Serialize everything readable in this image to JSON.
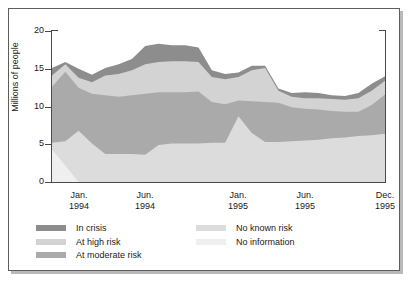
{
  "chart_data": {
    "type": "area",
    "stacked": true,
    "title": "",
    "xlabel": "",
    "ylabel": "Millions of people",
    "ylim": [
      0,
      20
    ],
    "yticks": [
      0,
      5,
      10,
      15,
      20
    ],
    "ytick_labels": [
      "0",
      "5",
      "10",
      "15",
      "20"
    ],
    "grid": false,
    "legend_position": "below-plot",
    "x": [
      "Nov. 1993",
      "Dec. 1993",
      "Jan. 1994",
      "Feb. 1994",
      "Mar. 1994",
      "Apr. 1994",
      "May 1994",
      "Jun. 1994",
      "Jul. 1994",
      "Aug. 1994",
      "Sep. 1994",
      "Oct. 1994",
      "Nov. 1994",
      "Dec. 1994",
      "Jan. 1995",
      "Feb. 1995",
      "Mar. 1995",
      "Apr. 1995",
      "May 1995",
      "Jun. 1995",
      "Jul. 1995",
      "Aug. 1995",
      "Sep. 1995",
      "Oct. 1995",
      "Nov. 1995",
      "Dec. 1995"
    ],
    "xtick_labels": [
      {
        "month": "Jan.",
        "year": "1994"
      },
      {
        "month": "Jun.",
        "year": "1994"
      },
      {
        "month": "Jan.",
        "year": "1995"
      },
      {
        "month": "Jun.",
        "year": "1995"
      },
      {
        "month": "Dec.",
        "year": "1995"
      }
    ],
    "xtick_index": [
      2,
      7,
      14,
      19,
      25
    ],
    "series": [
      {
        "name": "No information",
        "color": "#efefef",
        "stack_order": 1,
        "values": [
          4.3,
          2.2,
          0.0,
          0.0,
          0.0,
          0.0,
          0.0,
          0.0,
          0.0,
          0.0,
          0.0,
          0.0,
          0.0,
          0.0,
          0.0,
          0.0,
          0.0,
          0.0,
          0.0,
          0.0,
          0.0,
          0.0,
          0.0,
          0.0,
          0.0,
          0.0
        ]
      },
      {
        "name": "No known risk",
        "color": "#dcdcdc",
        "stack_order": 2,
        "values": [
          0.9,
          3.2,
          6.8,
          5.1,
          3.7,
          3.7,
          3.7,
          3.6,
          4.9,
          5.1,
          5.1,
          5.1,
          5.2,
          5.2,
          8.7,
          6.5,
          5.3,
          5.3,
          5.4,
          5.5,
          5.6,
          5.8,
          5.9,
          6.1,
          6.2,
          6.4
        ]
      },
      {
        "name": "At moderate risk",
        "color": "#aaaaaa",
        "stack_order": 3,
        "values": [
          7.4,
          9.2,
          5.7,
          6.6,
          7.8,
          7.6,
          7.8,
          8.1,
          7.0,
          6.8,
          6.8,
          6.9,
          5.4,
          5.1,
          2.1,
          4.2,
          5.3,
          5.2,
          4.5,
          4.2,
          4.0,
          3.6,
          3.4,
          3.2,
          4.0,
          5.2
        ]
      },
      {
        "name": "At high risk",
        "color": "#d3d3d3",
        "stack_order": 4,
        "values": [
          1.5,
          1.0,
          1.3,
          1.5,
          2.6,
          3.0,
          3.3,
          3.9,
          4.0,
          4.1,
          4.1,
          3.9,
          3.3,
          3.3,
          3.1,
          4.1,
          4.5,
          1.6,
          1.4,
          1.4,
          1.5,
          1.6,
          1.6,
          1.8,
          1.9,
          1.8
        ]
      },
      {
        "name": "In crisis",
        "color": "#8d8d8d",
        "stack_order": 5,
        "values": [
          1.0,
          0.3,
          1.2,
          1.0,
          1.0,
          1.3,
          1.5,
          2.4,
          2.4,
          2.1,
          2.1,
          1.9,
          0.9,
          0.7,
          0.6,
          0.6,
          0.3,
          0.3,
          0.5,
          0.8,
          0.7,
          0.5,
          0.5,
          0.7,
          0.9,
          0.6
        ]
      }
    ],
    "legend": [
      {
        "label": "In crisis",
        "color": "#8d8d8d"
      },
      {
        "label": "At high risk",
        "color": "#d3d3d3"
      },
      {
        "label": "At moderate risk",
        "color": "#aaaaaa"
      },
      {
        "label": "No known risk",
        "color": "#dcdcdc"
      },
      {
        "label": "No information",
        "color": "#efefef"
      }
    ],
    "legend_columns": [
      [
        "In crisis",
        "At high risk",
        "At moderate risk"
      ],
      [
        "No known risk",
        "No information"
      ]
    ]
  }
}
